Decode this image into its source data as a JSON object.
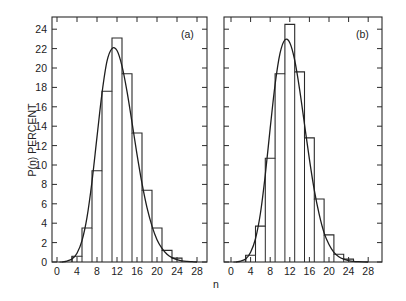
{
  "chart_data": [
    {
      "type": "bar",
      "panel_label": "(a)",
      "xlabel": "n",
      "ylabel": "P(n) PERCENT",
      "xlim": [
        -1,
        30
      ],
      "ylim": [
        0,
        25
      ],
      "xticks": [
        0,
        4,
        8,
        12,
        16,
        20,
        24,
        28
      ],
      "yticks": [
        0,
        2,
        4,
        6,
        8,
        10,
        12,
        14,
        16,
        18,
        20,
        22,
        24
      ],
      "grid": false,
      "histogram": {
        "bin_edges": [
          3,
          5,
          7,
          9,
          11,
          13,
          15,
          17,
          19,
          21,
          23,
          25
        ],
        "values": [
          0.6,
          3.5,
          9.4,
          17.6,
          23.1,
          19.4,
          13.3,
          7.4,
          3.5,
          1.2,
          0.4
        ]
      },
      "fit_curve": {
        "description": "smooth fitted distribution",
        "x": [
          1,
          2,
          3,
          4,
          5,
          6,
          7,
          8,
          9,
          10,
          11,
          12,
          13,
          14,
          15,
          16,
          17,
          18,
          19,
          20,
          21,
          22,
          23,
          24,
          25,
          26,
          27,
          28
        ],
        "y": [
          0.0,
          0.1,
          0.3,
          0.9,
          2.2,
          4.6,
          8.3,
          12.9,
          17.4,
          20.7,
          22.0,
          21.8,
          20.2,
          17.6,
          14.4,
          11.1,
          8.1,
          5.6,
          3.7,
          2.3,
          1.4,
          0.8,
          0.45,
          0.25,
          0.12,
          0.06,
          0.03,
          0.0
        ]
      }
    },
    {
      "type": "bar",
      "panel_label": "(b)",
      "xlabel": "n",
      "ylabel": "P(n) PERCENT",
      "xlim": [
        -1,
        31
      ],
      "ylim": [
        0,
        25
      ],
      "xticks": [
        0,
        4,
        8,
        12,
        16,
        20,
        24,
        28
      ],
      "yticks": [
        0,
        2,
        4,
        6,
        8,
        10,
        12,
        14,
        16,
        18,
        20,
        22,
        24
      ],
      "grid": false,
      "histogram": {
        "bin_edges": [
          3,
          5,
          7,
          9,
          11,
          13,
          15,
          17,
          19,
          21,
          23,
          25
        ],
        "values": [
          0.7,
          3.7,
          10.7,
          19.4,
          24.5,
          19.6,
          12.8,
          6.5,
          2.8,
          0.8,
          0.3
        ]
      },
      "fit_curve": {
        "description": "smooth fitted distribution",
        "x": [
          1,
          2,
          3,
          4,
          5,
          6,
          7,
          8,
          9,
          10,
          11,
          12,
          13,
          14,
          15,
          16,
          17,
          18,
          19,
          20,
          21,
          22,
          23,
          24,
          25,
          26,
          27,
          28
        ],
        "y": [
          0.0,
          0.1,
          0.3,
          1.0,
          2.4,
          5.0,
          9.0,
          13.8,
          18.3,
          21.5,
          22.9,
          22.6,
          20.8,
          17.8,
          14.2,
          10.6,
          7.4,
          4.9,
          3.0,
          1.8,
          1.0,
          0.55,
          0.3,
          0.15,
          0.07,
          0.03,
          0.01,
          0.0
        ]
      }
    }
  ],
  "layout": {
    "panels": [
      {
        "left": 52,
        "right": 207,
        "top": 17,
        "bottom": 262,
        "x0_px": 57,
        "x_px_per_unit": 5.0
      },
      {
        "left": 224,
        "right": 382,
        "top": 17,
        "bottom": 262,
        "x0_px": 231,
        "x_px_per_unit": 4.9
      }
    ],
    "y_px_per_unit": 9.7,
    "ylabel_pos": {
      "x": 36,
      "y": 140
    },
    "xlabel_pos": {
      "x": 216,
      "y": 288
    }
  }
}
